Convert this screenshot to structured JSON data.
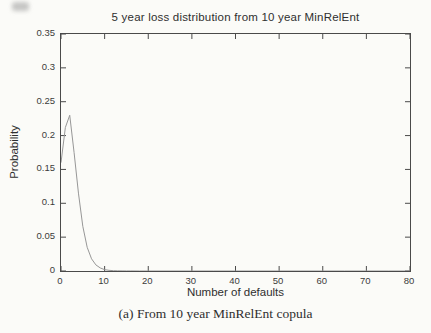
{
  "figure": {
    "caption": "(a) From 10 year MinRelEnt copula"
  },
  "chart_data": {
    "type": "line",
    "title": "5 year loss distribution from 10 year MinRelEnt",
    "xlabel": "Number of defaults",
    "ylabel": "Probability",
    "xlim": [
      0,
      80
    ],
    "ylim": [
      0,
      0.35
    ],
    "x_ticks": [
      0,
      10,
      20,
      30,
      40,
      50,
      60,
      70,
      80
    ],
    "x_tick_labels": [
      "0",
      "10",
      "20",
      "30",
      "40",
      "50",
      "60",
      "70",
      "80"
    ],
    "y_ticks": [
      0,
      0.05,
      0.1,
      0.15,
      0.2,
      0.25,
      0.3,
      0.35
    ],
    "y_tick_labels": [
      "0",
      "0.05",
      "0.1",
      "0.15",
      "0.2",
      "0.25",
      "0.3",
      "0.35"
    ],
    "grid": false,
    "legend": null,
    "box": true,
    "line_color": "#979797",
    "axis_color": "#4a4a4a",
    "series": [
      {
        "name": "5 year loss probability",
        "x": [
          0,
          1,
          2,
          3,
          4,
          5,
          6,
          7,
          8,
          9,
          10,
          11,
          12,
          13,
          14,
          15,
          16,
          18,
          20,
          25,
          30,
          35,
          40,
          45,
          50,
          55,
          60,
          65,
          70,
          75,
          80
        ],
        "y": [
          0.16,
          0.212,
          0.23,
          0.175,
          0.115,
          0.066,
          0.035,
          0.018,
          0.009,
          0.0045,
          0.002,
          0.001,
          0.0005,
          0.0003,
          0.0002,
          0.0001,
          0.0001,
          0,
          0,
          0,
          0,
          0,
          0,
          0,
          0,
          0,
          0,
          0,
          0,
          0,
          0
        ]
      }
    ]
  }
}
